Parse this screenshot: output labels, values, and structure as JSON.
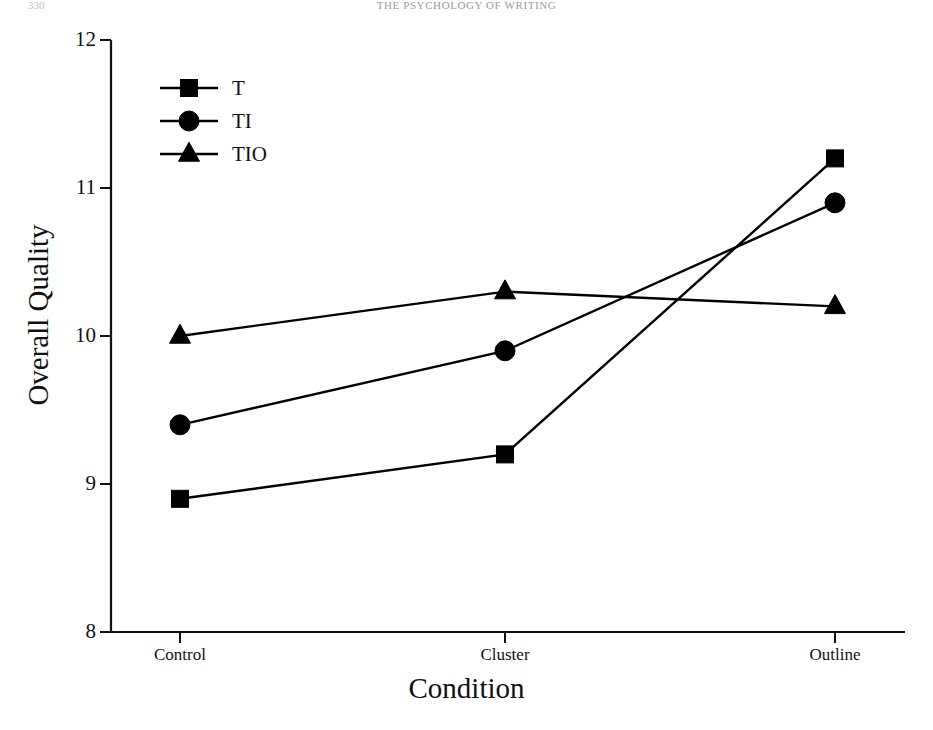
{
  "page": {
    "running_head": "THE PSYCHOLOGY OF WRITING",
    "page_number": "330"
  },
  "chart_data": {
    "type": "line",
    "title": "",
    "xlabel": "Condition",
    "ylabel": "Overall Quality",
    "categories": [
      "Control",
      "Cluster",
      "Outline"
    ],
    "series": [
      {
        "name": "T",
        "marker": "square",
        "values": [
          8.9,
          9.2,
          11.2
        ]
      },
      {
        "name": "TI",
        "marker": "circle",
        "values": [
          9.4,
          9.9,
          10.9
        ]
      },
      {
        "name": "TIO",
        "marker": "triangle",
        "values": [
          10.0,
          10.3,
          10.2
        ]
      }
    ],
    "ylim": [
      8,
      12
    ],
    "yticks": [
      "8",
      "9",
      "10",
      "11",
      "12"
    ],
    "grid": false,
    "legend_position": "top-left",
    "line_color": "#000000",
    "marker_color": "#000000"
  }
}
